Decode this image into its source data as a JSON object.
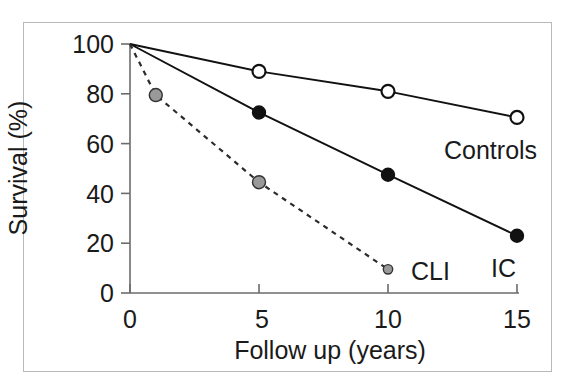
{
  "figure": {
    "background_color": "#ffffff",
    "frame_color": "#b9b9b9"
  },
  "chart_data": {
    "type": "line",
    "title": "",
    "subtitle": "",
    "xlabel": "Follow up  (years)",
    "ylabel": "Survival  (%)",
    "xlim": [
      0,
      15
    ],
    "ylim": [
      0,
      100
    ],
    "xticks": [
      0,
      5,
      10,
      15
    ],
    "xtick_labels": [
      "0",
      "5",
      "10",
      "15"
    ],
    "yticks": [
      0,
      20,
      40,
      60,
      80,
      100
    ],
    "ytick_labels": [
      "0",
      "20",
      "40",
      "60",
      "80",
      "100"
    ],
    "grid": false,
    "legend_position": "inline-annotations",
    "series": [
      {
        "name": "Controls",
        "label": "Controls",
        "x": [
          0,
          5,
          10,
          15
        ],
        "values": [
          100,
          89,
          81,
          70.5
        ],
        "line_style": "solid",
        "line_color": "#111111",
        "marker": "open-circle",
        "marker_fill": "#ffffff",
        "marker_edge": "#111111",
        "marker_size": 13
      },
      {
        "name": "IC",
        "label": "IC",
        "x": [
          0,
          5,
          10,
          15
        ],
        "values": [
          100,
          72.5,
          47.5,
          23
        ],
        "line_style": "solid",
        "line_color": "#111111",
        "marker": "filled-circle",
        "marker_fill": "#111111",
        "marker_edge": "#111111",
        "marker_size": 13
      },
      {
        "name": "CLI",
        "label": "CLI",
        "x": [
          0,
          1,
          5,
          10
        ],
        "values": [
          100,
          79.5,
          44.5,
          9.5
        ],
        "line_style": "dashed",
        "line_color": "#2b2b2b",
        "marker": "gray-circle",
        "marker_fill": "#999999",
        "marker_edge": "#333333",
        "marker_size": 13
      }
    ],
    "annotations": [
      {
        "text": "Controls",
        "x": 12.2,
        "y": 77
      },
      {
        "text": "IC",
        "x": 14.0,
        "y": 30
      },
      {
        "text": "CLI",
        "x": 10.9,
        "y": 29
      }
    ]
  },
  "axis": {
    "y_title": "Survival  (%)",
    "x_title": "Follow up  (years)",
    "y_labels": [
      "100",
      "80",
      "60",
      "40",
      "20",
      "0"
    ],
    "x_labels": [
      "0",
      "5",
      "10",
      "15"
    ]
  },
  "labels": {
    "controls": "Controls",
    "ic": "IC",
    "cli": "CLI"
  }
}
